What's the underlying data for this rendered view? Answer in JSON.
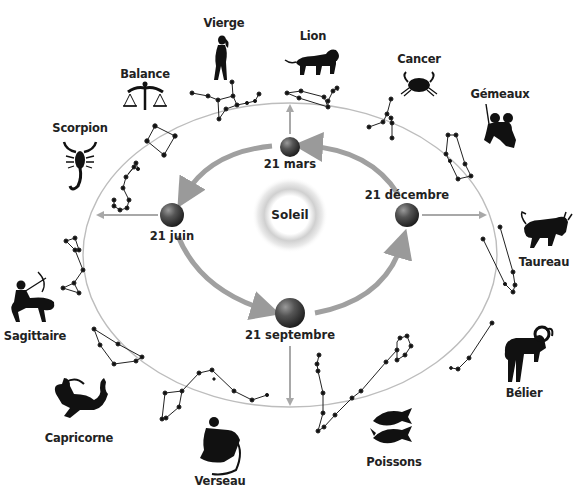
{
  "diagram": {
    "sun": {
      "label": "Soleil",
      "cx": 290,
      "cy": 215
    },
    "earth_positions": [
      {
        "id": "mars",
        "label": "21 mars",
        "cx": 290,
        "cy": 147,
        "r": 10,
        "label_x": 290,
        "label_y": 158
      },
      {
        "id": "juin",
        "label": "21 juin",
        "cx": 172,
        "cy": 215,
        "r": 12,
        "label_x": 172,
        "label_y": 230
      },
      {
        "id": "septembre",
        "label": "21 septembre",
        "cx": 290,
        "cy": 313,
        "r": 15,
        "label_x": 290,
        "label_y": 329
      },
      {
        "id": "decembre",
        "label": "21 décembre",
        "cx": 407,
        "cy": 215,
        "r": 12,
        "label_x": 407,
        "label_y": 189
      }
    ],
    "orbit_arrows_direction": "mars → juin → septembre → décembre → mars",
    "ecliptic_ellipse": {
      "cx": 290,
      "cy": 255,
      "rx": 207,
      "ry": 152
    },
    "constellations": [
      {
        "name": "Vierge",
        "label_x": 224,
        "label_y": 17,
        "icon": "virgo-figure-icon"
      },
      {
        "name": "Lion",
        "label_x": 313,
        "label_y": 30,
        "icon": "lion-icon"
      },
      {
        "name": "Cancer",
        "label_x": 419,
        "label_y": 53,
        "icon": "crab-icon"
      },
      {
        "name": "Gémeaux",
        "label_x": 500,
        "label_y": 88,
        "icon": "twins-icon"
      },
      {
        "name": "Taureau",
        "label_x": 544,
        "label_y": 256,
        "icon": "bull-icon"
      },
      {
        "name": "Bélier",
        "label_x": 524,
        "label_y": 387,
        "icon": "ram-icon"
      },
      {
        "name": "Poissons",
        "label_x": 394,
        "label_y": 456,
        "icon": "fish-icon"
      },
      {
        "name": "Verseau",
        "label_x": 220,
        "label_y": 473,
        "icon": "water-bearer-icon"
      },
      {
        "name": "Capricorne",
        "label_x": 79,
        "label_y": 432,
        "icon": "sea-goat-icon"
      },
      {
        "name": "Sagittaire",
        "label_x": 35,
        "label_y": 330,
        "icon": "archer-centaur-icon"
      },
      {
        "name": "Scorpion",
        "label_x": 80,
        "label_y": 122,
        "icon": "scorpion-icon"
      },
      {
        "name": "Balance",
        "label_x": 145,
        "label_y": 68,
        "icon": "scales-icon"
      }
    ],
    "colors": {
      "arrow": "#9a9a9a",
      "ellipse": "#b8b8b8",
      "ink": "#111111",
      "earth": "#3a3a3a"
    }
  }
}
